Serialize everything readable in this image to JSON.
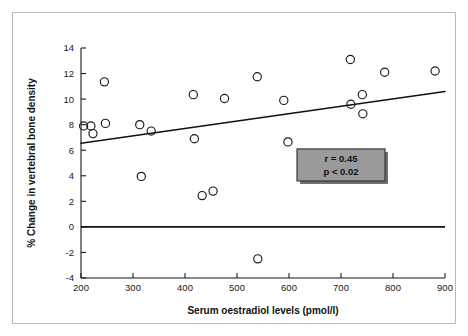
{
  "figure": {
    "border_color": "#b9b9b9",
    "background": "#ffffff"
  },
  "annotation": {
    "r_label": "r = 0.45",
    "p_label": "p < 0.02",
    "box_fill": "#9a9a9a",
    "box_border": "#3a3a3a"
  },
  "chart_data": {
    "type": "scatter",
    "title": "",
    "xlabel": "Serum oestradiol levels (pmol/l)",
    "ylabel": "% Change in vertebral bone density",
    "xlim": [
      200,
      900
    ],
    "ylim": [
      -4,
      14
    ],
    "xticks": [
      200,
      300,
      400,
      500,
      600,
      700,
      800,
      900
    ],
    "xticklabels": [
      "200",
      "300",
      "400",
      "500",
      "600",
      "700",
      "800",
      "900"
    ],
    "yticks": [
      -4,
      -2,
      0,
      2,
      4,
      6,
      8,
      10,
      12,
      14
    ],
    "yticklabels": [
      "-4",
      "-2",
      "0",
      "2",
      "4",
      "6",
      "8",
      "10",
      "12",
      "14"
    ],
    "grid": false,
    "legend": false,
    "marker": "open-circle",
    "points": [
      {
        "x": 205,
        "y": 7.9
      },
      {
        "x": 219,
        "y": 7.9
      },
      {
        "x": 223,
        "y": 7.3
      },
      {
        "x": 245,
        "y": 11.35
      },
      {
        "x": 247,
        "y": 8.1
      },
      {
        "x": 313,
        "y": 8.0
      },
      {
        "x": 316,
        "y": 3.95
      },
      {
        "x": 335,
        "y": 7.5
      },
      {
        "x": 416,
        "y": 10.35
      },
      {
        "x": 418,
        "y": 6.9
      },
      {
        "x": 433,
        "y": 2.45
      },
      {
        "x": 454,
        "y": 2.8
      },
      {
        "x": 476,
        "y": 10.05
      },
      {
        "x": 539,
        "y": 11.75
      },
      {
        "x": 540,
        "y": -2.5
      },
      {
        "x": 590,
        "y": 9.9
      },
      {
        "x": 598,
        "y": 6.65
      },
      {
        "x": 718,
        "y": 13.1
      },
      {
        "x": 719,
        "y": 9.6
      },
      {
        "x": 741,
        "y": 10.35
      },
      {
        "x": 742,
        "y": 8.85
      },
      {
        "x": 784,
        "y": 12.1
      },
      {
        "x": 881,
        "y": 12.2
      }
    ],
    "reference_line": {
      "y": 0,
      "label": "zero-change-line"
    },
    "fit_line": {
      "x": [
        200,
        900
      ],
      "y": [
        6.55,
        10.6
      ],
      "label": "regression-line"
    },
    "annotations": [
      {
        "text": "r = 0.45",
        "x": 700,
        "y": 5.4
      },
      {
        "text": "p < 0.02",
        "x": 700,
        "y": 4.2
      }
    ]
  }
}
